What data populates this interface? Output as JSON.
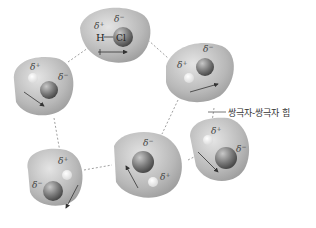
{
  "diagram": {
    "label": "쌍극자-쌍극자 힘",
    "molecule_label_h": "H",
    "molecule_label_cl": "Cl",
    "delta_plus": "δ+",
    "delta_minus": "δ−",
    "molecule_count": 6,
    "colors": {
      "cloud": "#b8b8b8",
      "cloud_edge": "#9a9a9a",
      "atom_cl": "#7a7a7a",
      "atom_h": "#eeeeee",
      "dashed_line": "#888888"
    }
  }
}
